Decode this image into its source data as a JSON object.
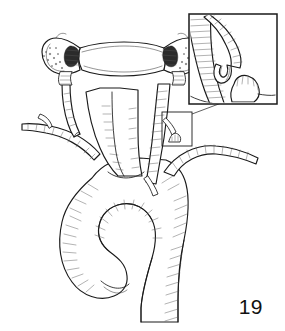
{
  "figure": {
    "number": "19",
    "kind": "line-art anatomical surgical illustration",
    "background_color": "#ffffff",
    "ink_color": "#1a1a1a",
    "shading_color": "#8d8d8d",
    "width_px": 285,
    "height_px": 331
  },
  "inset": {
    "present": true,
    "label": "",
    "frame_color": "#1a1a1a",
    "bounds": {
      "x": 189,
      "y": 14,
      "width": 88,
      "height": 90
    },
    "content": "magnified detail of transected vessel branch stump beside hatched parent artery"
  },
  "callout": {
    "present": true,
    "bounds": {
      "x": 162,
      "y": 112,
      "width": 30,
      "height": 34
    },
    "leader_from": {
      "x": 192,
      "y": 114
    },
    "leader_to": {
      "x": 222,
      "y": 104
    }
  },
  "structures": [
    {
      "id": "vertebra",
      "name": "Cervical vertebra (transected transverse processes)",
      "region": "top-center"
    },
    {
      "id": "vertebral-artery-left",
      "name": "Left vertebral artery",
      "region": "upper-left"
    },
    {
      "id": "vertebral-artery-right",
      "name": "Right vertebral artery",
      "region": "upper-right"
    },
    {
      "id": "common-carotid-left",
      "name": "Left common carotid artery",
      "region": "center"
    },
    {
      "id": "subclavian-left",
      "name": "Left subclavian artery",
      "region": "left"
    },
    {
      "id": "subclavian-right",
      "name": "Right subclavian artery",
      "region": "right"
    },
    {
      "id": "brachiocephalic-trunk",
      "name": "Brachiocephalic trunk",
      "region": "center"
    },
    {
      "id": "aortic-arch",
      "name": "Aortic arch",
      "region": "bottom-center"
    },
    {
      "id": "descending-aorta",
      "name": "Descending aorta",
      "region": "bottom-right"
    },
    {
      "id": "vessel-stump",
      "name": "Ligated / transected vessel stump",
      "region": "inset"
    }
  ]
}
